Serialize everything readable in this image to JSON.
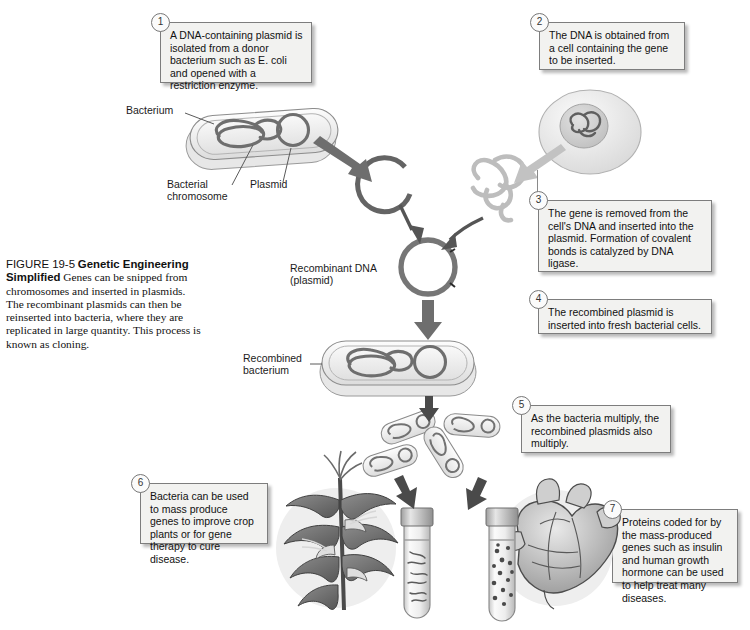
{
  "figure": {
    "number": "FIGURE 19-5",
    "title": "Genetic Engineering Simplified",
    "caption": "Genes can be snipped from chromosomes and inserted in plasmids. The recombinant plasmids can then be reinserted into bacteria, where they are replicated in large quantity. This process is known as cloning."
  },
  "steps": [
    {
      "num": "1",
      "text": "A DNA-containing plasmid is isolated from a donor bacterium such as E. coli and opened with a restriction enzyme."
    },
    {
      "num": "2",
      "text": "The DNA is obtained from a cell containing the gene to be inserted."
    },
    {
      "num": "3",
      "text": "The gene is removed from the cell's DNA and inserted into the plasmid. Formation of covalent bonds is catalyzed by DNA ligase."
    },
    {
      "num": "4",
      "text": "The recombined plasmid is inserted into fresh bacterial cells."
    },
    {
      "num": "5",
      "text": "As the bacteria multiply, the recombined plasmids also multiply."
    },
    {
      "num": "6",
      "text": "Bacteria can be used to mass produce genes to improve crop plants or for gene therapy to cure disease."
    },
    {
      "num": "7",
      "text": "Proteins coded for by the mass-produced genes such as insulin and human growth hormone can be used to help treat many diseases."
    }
  ],
  "labels": {
    "bacterium": "Bacterium",
    "bacterial_chromosome": "Bacterial\nchromosome",
    "bacterial_chromosome_line1": "Bacterial",
    "bacterial_chromosome_line2": "chromosome",
    "plasmid": "Plasmid",
    "recombinant_dna_line1": "Recombinant DNA",
    "recombinant_dna_line2": "(plasmid)",
    "recombined_bacterium_line1": "Recombined",
    "recombined_bacterium_line2": "bacterium"
  },
  "colors": {
    "callout_fill": "#f2f2f0",
    "callout_border": "#7d7d7d",
    "dark_arrow": "#6e6e6e",
    "light_arrow": "#bdbdbd",
    "plasmid_stroke": "#5d5d5d",
    "gene_dna": "#b9b9b9",
    "cell_fill": "#eceaea",
    "halo": "#eeeeee",
    "page_background": "#ffffff"
  },
  "graphics": {
    "donor_bacterium": "rod-shaped bacterium with coiled chromosome and circular plasmid",
    "donor_cell": "eukaryotic cell with nucleus containing tangled DNA",
    "opened_plasmid": "open circular plasmid (C shape) cut by restriction enzyme",
    "gene_fragment": "light gray tangled DNA gene fragment",
    "recombinant_plasmid": "closed circular plasmid with two ligation marks",
    "recombined_bacterium": "rod bacterium containing chromosome and recombinant plasmid",
    "multiplying_bacteria_count": 4,
    "corn_plant": "corn plant illustration",
    "human_heart": "human heart illustration",
    "test_tube_left": "test tube containing cultured bacteria",
    "test_tube_right": "test tube containing protein granules"
  }
}
